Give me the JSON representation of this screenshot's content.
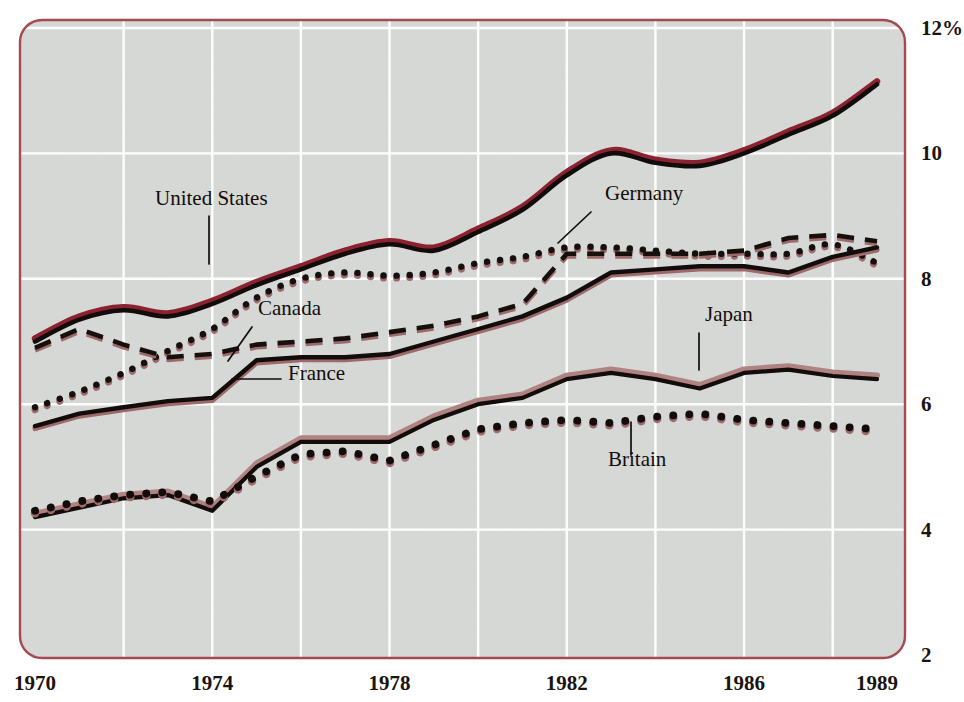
{
  "chart_data": {
    "type": "line",
    "title": "",
    "subtitle": "",
    "xlabel": "",
    "ylabel": "",
    "unit": "%",
    "xlim": [
      1970,
      1989
    ],
    "ylim": [
      2,
      12
    ],
    "grid": true,
    "legend_position": "inline-annotations",
    "x_tick_labels": [
      "1970",
      "1974",
      "1978",
      "1982",
      "1986",
      "1989"
    ],
    "x_tick_values": [
      1970,
      1974,
      1978,
      1982,
      1986,
      1989
    ],
    "y_tick_labels": [
      "12%",
      "10",
      "8",
      "6",
      "4",
      "2"
    ],
    "y_tick_values": [
      12,
      10,
      8,
      6,
      4,
      2
    ],
    "x_gridline_values": [
      1972,
      1974,
      1976,
      1978,
      1980,
      1982,
      1984,
      1986,
      1988
    ],
    "x": [
      1970,
      1971,
      1972,
      1973,
      1974,
      1975,
      1976,
      1977,
      1978,
      1979,
      1980,
      1981,
      1982,
      1983,
      1984,
      1985,
      1986,
      1987,
      1988,
      1989
    ],
    "series": [
      {
        "name": "United States",
        "style": "thick-red-black",
        "color": "#8c2230",
        "values": [
          7.0,
          7.35,
          7.5,
          7.4,
          7.6,
          7.9,
          8.15,
          8.4,
          8.55,
          8.45,
          8.75,
          9.1,
          9.65,
          10.0,
          9.85,
          9.8,
          10.0,
          10.3,
          10.6,
          11.1
        ],
        "label_position": {
          "x": 155,
          "y": 205
        }
      },
      {
        "name": "Canada",
        "style": "dotted",
        "color": "#9c6a6a",
        "values": [
          5.95,
          6.2,
          6.5,
          6.85,
          7.2,
          7.7,
          8.0,
          8.1,
          8.05,
          8.1,
          8.25,
          8.35,
          8.5,
          8.5,
          8.45,
          8.4,
          8.4,
          8.4,
          8.55,
          8.25
        ],
        "label_position": {
          "x": 258,
          "y": 315
        }
      },
      {
        "name": "Germany",
        "style": "dashed",
        "color": "#16100d",
        "values": [
          6.9,
          7.2,
          6.95,
          6.75,
          6.8,
          6.95,
          7.0,
          7.05,
          7.15,
          7.25,
          7.4,
          7.6,
          8.4,
          8.4,
          8.4,
          8.4,
          8.45,
          8.65,
          8.7,
          8.6
        ],
        "label_position": {
          "x": 605,
          "y": 200
        }
      },
      {
        "name": "France",
        "style": "solid-black",
        "color": "#120d0a",
        "values": [
          5.65,
          5.85,
          5.95,
          6.05,
          6.1,
          6.7,
          6.75,
          6.75,
          6.8,
          7.0,
          7.2,
          7.4,
          7.7,
          8.1,
          8.15,
          8.2,
          8.2,
          8.1,
          8.35,
          8.5
        ],
        "label_position": {
          "x": 288,
          "y": 380
        }
      },
      {
        "name": "Japan",
        "style": "thick-pink-black",
        "color": "#b08383",
        "values": [
          4.2,
          4.35,
          4.5,
          4.55,
          4.3,
          5.0,
          5.4,
          5.4,
          5.4,
          5.75,
          6.0,
          6.1,
          6.4,
          6.5,
          6.4,
          6.25,
          6.5,
          6.55,
          6.45,
          6.4
        ],
        "label_position": {
          "x": 705,
          "y": 321
        }
      },
      {
        "name": "Britain",
        "style": "heavy-dots",
        "color": "#120d0a",
        "values": [
          4.3,
          4.45,
          4.55,
          4.6,
          4.45,
          4.85,
          5.2,
          5.25,
          5.1,
          5.35,
          5.6,
          5.7,
          5.75,
          5.7,
          5.8,
          5.85,
          5.75,
          5.7,
          5.65,
          5.6
        ],
        "label_position": {
          "x": 608,
          "y": 466
        }
      }
    ],
    "annotations": [
      {
        "text": "United States",
        "leader_from": [
          209,
          216
        ],
        "leader_to": [
          209,
          264
        ]
      },
      {
        "text": "Canada",
        "leader_from": [
          252,
          327
        ],
        "leader_to": [
          228,
          361
        ]
      },
      {
        "text": "France",
        "leader_from": [
          281,
          379
        ],
        "leader_to": [
          232,
          379
        ]
      },
      {
        "text": "Germany",
        "leader_from": [
          591,
          212
        ],
        "leader_to": [
          558,
          243
        ]
      },
      {
        "text": "Japan",
        "leader_from": [
          699,
          333
        ],
        "leader_to": [
          699,
          370
        ]
      },
      {
        "text": "Britain",
        "leader_from": [
          631,
          455
        ],
        "leader_to": [
          631,
          422
        ]
      }
    ],
    "colors": {
      "plot_background": "#e3e5e3",
      "border": "#a34a52",
      "gridline": "#ffffff",
      "accent_red": "#8c2230",
      "accent_pink": "#b08383",
      "ink": "#120d0a",
      "page_background": "#ffffff"
    }
  }
}
